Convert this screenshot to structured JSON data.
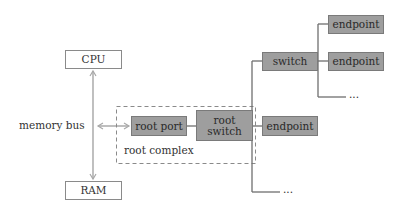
{
  "diagram": {
    "nodes": {
      "cpu": "CPU",
      "ram": "RAM",
      "root_port": "root port",
      "root_switch_line1": "root",
      "root_switch_line2": "switch",
      "switch": "switch",
      "endpoint_top": "endpoint",
      "endpoint_mid": "endpoint",
      "endpoint_root": "endpoint"
    },
    "labels": {
      "memory_bus": "memory bus",
      "root_complex": "root complex",
      "ellipsis_switch": "...",
      "ellipsis_root": "..."
    },
    "colors": {
      "box_fill": "#9e9e9e",
      "line": "#6f6f6f",
      "arrow": "#b0b0b0",
      "dashed": "#8a8a8a"
    }
  }
}
